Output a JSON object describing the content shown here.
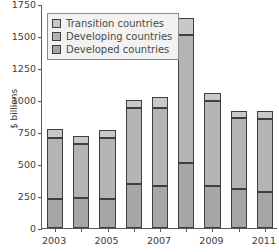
{
  "chart_data": {
    "type": "bar",
    "subtype": "stacked-bar",
    "title": "",
    "xlabel": "",
    "ylabel": "$ billions",
    "ylim": [
      0,
      1750
    ],
    "yticks": [
      0,
      250,
      500,
      750,
      1000,
      1250,
      1500,
      1750
    ],
    "ytick_labels": [
      "0",
      "250",
      "500",
      "750",
      "1000",
      "1250",
      "1500",
      "1750"
    ],
    "grid": false,
    "legend_position": "upper-left",
    "categories": [
      "2003",
      "2004",
      "2005",
      "2006",
      "2007",
      "2008",
      "2009",
      "2010",
      "2011"
    ],
    "xtick_labels": [
      "2003",
      "2005",
      "2007",
      "2009",
      "2011"
    ],
    "xtick_label_categories": [
      "2003",
      "2005",
      "2007",
      "2009",
      "2011"
    ],
    "series": [
      {
        "name": "Developed countries",
        "color": "#a6a6a6",
        "values": [
          225,
          235,
          225,
          345,
          330,
          505,
          325,
          305,
          280
        ]
      },
      {
        "name": "Developing countries",
        "color": "#b4b4b4",
        "values": [
          475,
          420,
          475,
          590,
          605,
          1005,
          670,
          555,
          575
        ]
      },
      {
        "name": "Transition countries",
        "color": "#c8c8c8",
        "values": [
          70,
          60,
          65,
          65,
          85,
          130,
          60,
          55,
          60
        ]
      }
    ],
    "totals": [
      770,
      715,
      765,
      1000,
      1020,
      1640,
      1055,
      915,
      915
    ]
  },
  "legend": {
    "items": [
      {
        "label": "Transition countries",
        "swatch_name": "legend-swatch-transition"
      },
      {
        "label": "Developing countries",
        "swatch_name": "legend-swatch-developing"
      },
      {
        "label": "Developed countries",
        "swatch_name": "legend-swatch-developed"
      }
    ]
  },
  "colors": {
    "transition": "#c8c8c8",
    "developing": "#b4b4b4",
    "developed": "#a6a6a6",
    "outline": "#3f3f3f",
    "axis": "#5a5a5a",
    "text": "#3b3b3b",
    "legend_background": "#f2f2f2",
    "legend_border": "#8c8c8c",
    "plot_background": "#ffffff"
  }
}
